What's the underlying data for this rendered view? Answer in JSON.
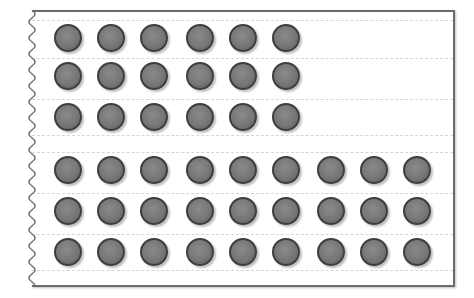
{
  "diagram": {
    "groups": [
      {
        "name": "top-group",
        "rows": 3,
        "per_row": 6,
        "total": 18
      },
      {
        "name": "bottom-group",
        "rows": 3,
        "per_row": 9,
        "total": 27
      }
    ],
    "total_dots": 45,
    "colors": {
      "dot_fill": "#777777",
      "dot_border": "#3e3e3e",
      "paper_border": "#6a6a6a",
      "rule_line": "#d6d6d6"
    }
  }
}
